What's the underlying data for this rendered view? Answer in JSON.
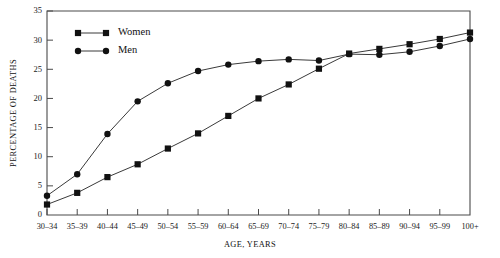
{
  "chart_data": {
    "type": "line",
    "title": "",
    "xlabel": "AGE, YEARS",
    "ylabel": "PERCENTAGE OF DEATHS",
    "categories": [
      "30–34",
      "35–39",
      "40–44",
      "45–49",
      "50–54",
      "55–59",
      "60–64",
      "65–69",
      "70–74",
      "75–79",
      "80–84",
      "85–89",
      "90–94",
      "95–99",
      "100+"
    ],
    "yticks": [
      0,
      5,
      10,
      15,
      20,
      25,
      30,
      35
    ],
    "ylim": [
      0,
      35
    ],
    "grid": false,
    "legend_position": "top-left",
    "series": [
      {
        "name": "Women",
        "marker": "square",
        "values": [
          1.8,
          3.8,
          6.5,
          8.7,
          11.4,
          14.0,
          17.0,
          20.0,
          22.4,
          25.1,
          27.7,
          28.5,
          29.3,
          30.2,
          31.3
        ]
      },
      {
        "name": "Men",
        "marker": "circle",
        "values": [
          3.3,
          7.0,
          13.9,
          19.5,
          22.6,
          24.7,
          25.8,
          26.4,
          26.7,
          26.5,
          27.6,
          27.5,
          28.0,
          29.0,
          30.2
        ]
      }
    ]
  },
  "legend": {
    "entries": [
      {
        "label": "Women"
      },
      {
        "label": "Men"
      }
    ]
  },
  "axes": {
    "y_title": "PERCENTAGE OF DEATHS",
    "x_title": "AGE, YEARS"
  }
}
